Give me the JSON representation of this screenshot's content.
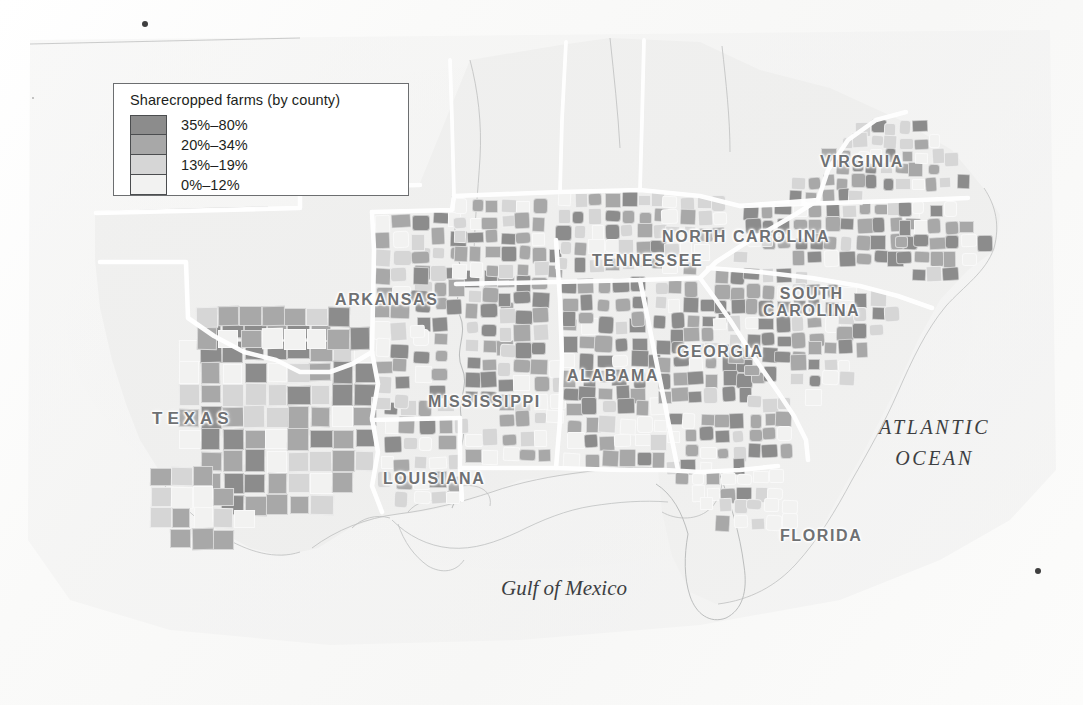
{
  "figure": {
    "kind": "thematic-choropleth-map",
    "region": "American South",
    "background_color": "#fbfbfa"
  },
  "legend": {
    "title": "Sharecropped farms (by county)",
    "border_color": "#6c6e70",
    "entries": [
      {
        "label": "35%–80%",
        "color": "#8c8c8c",
        "min": 35,
        "max": 80
      },
      {
        "label": "20%–34%",
        "color": "#a8a8a8",
        "min": 20,
        "max": 34
      },
      {
        "label": "13%–19%",
        "color": "#d6d6d6",
        "min": 13,
        "max": 19
      },
      {
        "label": "0%–12%",
        "color": "#f2f2f1",
        "min": 0,
        "max": 12
      }
    ]
  },
  "state_labels": [
    {
      "name": "TEXAS",
      "lines": [
        "TEXAS"
      ],
      "x": 152,
      "y": 410,
      "size": 17,
      "tracking": 5.0
    },
    {
      "name": "ARKANSAS",
      "lines": [
        "ARKANSAS"
      ],
      "x": 335,
      "y": 291,
      "size": 16,
      "tracking": 1.6
    },
    {
      "name": "LOUISIANA",
      "lines": [
        "LOUISIANA"
      ],
      "x": 383,
      "y": 470,
      "size": 16,
      "tracking": 1.6
    },
    {
      "name": "MISSISSIPPI",
      "lines": [
        "MISSISSIPPI"
      ],
      "x": 428,
      "y": 393,
      "size": 16,
      "tracking": 1.6
    },
    {
      "name": "ALABAMA",
      "lines": [
        "ALABAMA"
      ],
      "x": 567,
      "y": 367,
      "size": 16,
      "tracking": 1.6
    },
    {
      "name": "TENNESSEE",
      "lines": [
        "TENNESSEE"
      ],
      "x": 592,
      "y": 252,
      "size": 16,
      "tracking": 1.6
    },
    {
      "name": "GEORGIA",
      "lines": [
        "GEORGIA"
      ],
      "x": 677,
      "y": 343,
      "size": 16,
      "tracking": 1.6
    },
    {
      "name": "FLORIDA",
      "lines": [
        "FLORIDA"
      ],
      "x": 780,
      "y": 527,
      "size": 16,
      "tracking": 1.6
    },
    {
      "name": "VIRGINIA",
      "lines": [
        "VIRGINIA"
      ],
      "x": 820,
      "y": 153,
      "size": 16,
      "tracking": 1.6
    },
    {
      "name": "NORTH CAROLINA",
      "lines": [
        "NORTH CAROLINA"
      ],
      "x": 662,
      "y": 228,
      "size": 16,
      "tracking": 1.6
    },
    {
      "name": "SOUTH CAROLINA",
      "lines": [
        "SOUTH",
        "CAROLINA"
      ],
      "x": 763,
      "y": 285,
      "size": 16,
      "tracking": 1.6
    }
  ],
  "water_labels": [
    {
      "name": "ATLANTIC OCEAN",
      "lines": [
        "ATLANTIC",
        "OCEAN"
      ],
      "x": 879,
      "y": 412,
      "size": 20,
      "caps": true
    },
    {
      "name": "Gulf of Mexico",
      "lines": [
        "Gulf of Mexico"
      ],
      "x": 501,
      "y": 572,
      "size": 21,
      "caps": false
    }
  ],
  "map_data": {
    "type": "choropleth",
    "measure": "Share of farms operated by sharecroppers, by county",
    "class_breaks": [
      0,
      13,
      20,
      35,
      80
    ],
    "shaded_states": [
      "Texas",
      "Oklahoma",
      "Arkansas",
      "Louisiana",
      "Mississippi",
      "Alabama",
      "Tennessee",
      "Georgia",
      "Florida",
      "South Carolina",
      "North Carolina",
      "Virginia"
    ],
    "notes": "Highest sharecropping concentrations form a belt across the Mississippi Delta, the Alabama-Georgia Black Belt, and the Carolina Piedmont; Florida, Appalachia and west Texas are largely unshaded."
  },
  "scan_specks": [
    {
      "x": 145,
      "y": 24,
      "r": 3.4
    },
    {
      "x": 1038,
      "y": 571,
      "r": 3.2
    },
    {
      "x": 33,
      "y": 98,
      "r": 1.3
    }
  ]
}
